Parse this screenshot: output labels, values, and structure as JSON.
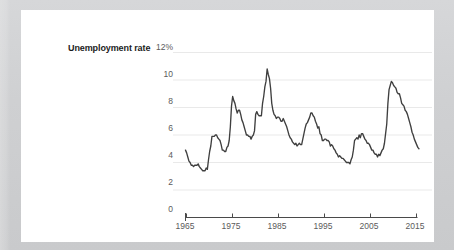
{
  "figure": {
    "series_label": "Unemployment rate",
    "note": "",
    "accent_color": "#3f3f3f",
    "gridline_color": "#e9e9e9",
    "axis_color": "#4a4a4a",
    "tick_text_color": "#5b5b5b",
    "card_color": "#ffffff",
    "page_color": "#cfd0d2"
  },
  "chart_data": {
    "type": "line",
    "title": "Unemployment rate",
    "xlabel": "",
    "ylabel": "Unemployment rate",
    "ylim": [
      0,
      12
    ],
    "xlim": [
      1965,
      2016
    ],
    "yticks": [
      0,
      2,
      4,
      6,
      8,
      10,
      12
    ],
    "ytick_labels": [
      "0",
      "2",
      "4",
      "6",
      "8",
      "10",
      "12%"
    ],
    "xticks": [
      1965,
      1975,
      1985,
      1995,
      2005,
      2015
    ],
    "xtick_labels": [
      "1965",
      "1975",
      "1985",
      "1995",
      "2005",
      "2015"
    ],
    "grid": "horizontal",
    "legend": "inline-left-label",
    "units": "percent",
    "series": [
      {
        "name": "Unemployment rate",
        "color": "#3f3f3f",
        "x": [
          1965.0,
          1965.25,
          1965.5,
          1965.75,
          1966.0,
          1966.25,
          1966.5,
          1966.75,
          1967.0,
          1967.25,
          1967.5,
          1967.75,
          1968.0,
          1968.25,
          1968.5,
          1968.75,
          1969.0,
          1969.25,
          1969.5,
          1969.75,
          1970.0,
          1970.25,
          1970.5,
          1970.75,
          1971.0,
          1971.25,
          1971.5,
          1971.75,
          1972.0,
          1972.25,
          1972.5,
          1972.75,
          1973.0,
          1973.25,
          1973.5,
          1973.75,
          1974.0,
          1974.25,
          1974.5,
          1974.75,
          1975.0,
          1975.25,
          1975.5,
          1975.75,
          1976.0,
          1976.25,
          1976.5,
          1976.75,
          1977.0,
          1977.25,
          1977.5,
          1977.75,
          1978.0,
          1978.25,
          1978.5,
          1978.75,
          1979.0,
          1979.25,
          1979.5,
          1979.75,
          1980.0,
          1980.25,
          1980.5,
          1980.75,
          1981.0,
          1981.25,
          1981.5,
          1981.75,
          1982.0,
          1982.25,
          1982.5,
          1982.75,
          1983.0,
          1983.25,
          1983.5,
          1983.75,
          1984.0,
          1984.25,
          1984.5,
          1984.75,
          1985.0,
          1985.25,
          1985.5,
          1985.75,
          1986.0,
          1986.25,
          1986.5,
          1986.75,
          1987.0,
          1987.25,
          1987.5,
          1987.75,
          1988.0,
          1988.25,
          1988.5,
          1988.75,
          1989.0,
          1989.25,
          1989.5,
          1989.75,
          1990.0,
          1990.25,
          1990.5,
          1990.75,
          1991.0,
          1991.25,
          1991.5,
          1991.75,
          1992.0,
          1992.25,
          1992.5,
          1992.75,
          1993.0,
          1993.25,
          1993.5,
          1993.75,
          1994.0,
          1994.25,
          1994.5,
          1994.75,
          1995.0,
          1995.25,
          1995.5,
          1995.75,
          1996.0,
          1996.25,
          1996.5,
          1996.75,
          1997.0,
          1997.25,
          1997.5,
          1997.75,
          1998.0,
          1998.25,
          1998.5,
          1998.75,
          1999.0,
          1999.25,
          1999.5,
          1999.75,
          2000.0,
          2000.25,
          2000.5,
          2000.75,
          2001.0,
          2001.25,
          2001.5,
          2001.75,
          2002.0,
          2002.25,
          2002.5,
          2002.75,
          2003.0,
          2003.25,
          2003.5,
          2003.75,
          2004.0,
          2004.25,
          2004.5,
          2004.75,
          2005.0,
          2005.25,
          2005.5,
          2005.75,
          2006.0,
          2006.25,
          2006.5,
          2006.75,
          2007.0,
          2007.25,
          2007.5,
          2007.75,
          2008.0,
          2008.25,
          2008.5,
          2008.75,
          2009.0,
          2009.25,
          2009.5,
          2009.75,
          2010.0,
          2010.25,
          2010.5,
          2010.75,
          2011.0,
          2011.25,
          2011.5,
          2011.75,
          2012.0,
          2012.25,
          2012.5,
          2012.75,
          2013.0,
          2013.25,
          2013.5,
          2013.75,
          2014.0,
          2014.25,
          2014.5,
          2014.75,
          2015.0,
          2015.25,
          2015.5,
          2015.75
        ],
        "values": [
          4.9,
          4.7,
          4.4,
          4.1,
          4.0,
          3.8,
          3.8,
          3.7,
          3.8,
          3.8,
          3.8,
          3.9,
          3.7,
          3.6,
          3.5,
          3.4,
          3.4,
          3.4,
          3.6,
          3.5,
          4.2,
          4.8,
          5.2,
          5.9,
          5.9,
          5.9,
          6.0,
          6.0,
          5.8,
          5.7,
          5.6,
          5.3,
          4.9,
          4.9,
          4.8,
          4.8,
          5.1,
          5.2,
          5.6,
          6.6,
          8.1,
          8.8,
          8.5,
          8.3,
          7.9,
          7.6,
          7.8,
          7.8,
          7.5,
          7.1,
          6.9,
          6.6,
          6.3,
          6.0,
          6.0,
          5.9,
          5.9,
          5.7,
          5.9,
          6.0,
          6.3,
          7.5,
          7.7,
          7.5,
          7.4,
          7.4,
          7.4,
          8.3,
          8.8,
          9.5,
          9.9,
          10.8,
          10.4,
          10.1,
          9.4,
          8.3,
          7.8,
          7.5,
          7.4,
          7.2,
          7.3,
          7.3,
          7.2,
          7.0,
          7.0,
          7.2,
          7.0,
          6.8,
          6.6,
          6.3,
          6.0,
          5.8,
          5.7,
          5.5,
          5.4,
          5.3,
          5.4,
          5.2,
          5.3,
          5.4,
          5.3,
          5.3,
          5.7,
          6.1,
          6.5,
          6.8,
          6.9,
          7.1,
          7.3,
          7.6,
          7.6,
          7.4,
          7.3,
          7.0,
          6.8,
          6.5,
          6.6,
          6.1,
          6.0,
          5.6,
          5.6,
          5.7,
          5.7,
          5.6,
          5.6,
          5.5,
          5.2,
          5.3,
          5.2,
          5.0,
          4.9,
          4.7,
          4.6,
          4.4,
          4.5,
          4.4,
          4.3,
          4.3,
          4.2,
          4.1,
          4.0,
          4.0,
          4.0,
          3.9,
          4.2,
          4.4,
          4.9,
          5.6,
          5.7,
          5.8,
          5.7,
          6.0,
          5.8,
          6.1,
          6.1,
          5.9,
          5.7,
          5.6,
          5.4,
          5.4,
          5.3,
          5.1,
          4.9,
          4.9,
          4.7,
          4.6,
          4.6,
          4.4,
          4.6,
          4.5,
          4.7,
          4.9,
          5.0,
          5.4,
          6.1,
          6.8,
          8.3,
          9.3,
          9.6,
          9.9,
          9.8,
          9.6,
          9.5,
          9.4,
          9.1,
          9.0,
          9.0,
          8.7,
          8.3,
          8.2,
          8.1,
          7.8,
          7.7,
          7.5,
          7.2,
          6.9,
          6.6,
          6.2,
          6.0,
          5.7,
          5.5,
          5.3,
          5.1,
          5.0
        ]
      }
    ]
  }
}
